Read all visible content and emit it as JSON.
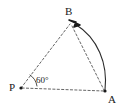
{
  "figure": {
    "type": "geometry-diagram",
    "background_color": "#ffffff",
    "stroke_color": "#2b2b2b",
    "dash_color": "#555555",
    "points": [
      {
        "name": "P",
        "label": "P",
        "x": 21,
        "y": 88
      },
      {
        "name": "A",
        "label": "A",
        "x": 105,
        "y": 91
      },
      {
        "name": "B",
        "label": "B",
        "x": 71,
        "y": 23
      }
    ],
    "angles": [
      {
        "at": "P",
        "label": "60°",
        "value": 60,
        "unit": "degrees"
      }
    ],
    "segments": [
      {
        "name": "P-B",
        "from": "P",
        "to": "B",
        "style": "dashed"
      },
      {
        "name": "P-A",
        "from": "P",
        "to": "A",
        "style": "dashed"
      },
      {
        "name": "B-A",
        "from": "B",
        "to": "A",
        "style": "dashed"
      }
    ],
    "arcs": [
      {
        "name": "A-to-B-arc",
        "from": "A",
        "to": "B",
        "style": "solid",
        "arrowhead_at": "B"
      },
      {
        "name": "angle-arc-at-P",
        "style": "solid",
        "at": "P"
      }
    ]
  }
}
